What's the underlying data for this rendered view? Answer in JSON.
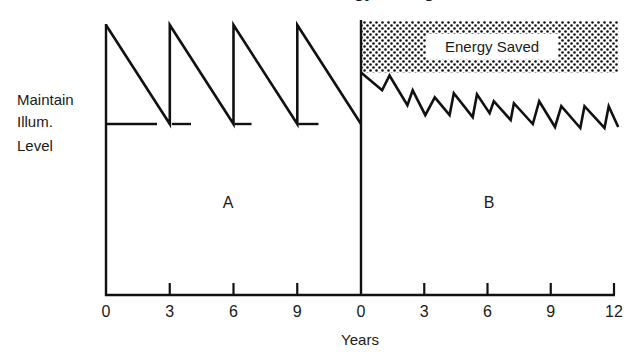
{
  "chart_data": {
    "type": "line",
    "title": "Energy Savings",
    "xlabel": "Years",
    "ylabel": "Maintain Illum. Level",
    "ylabel_lines": [
      "Maintain",
      "Illum.",
      "Level"
    ],
    "grid": false,
    "legend": null,
    "y_units": "relative illumination (maintain level = 0.0, initial = 1.0)",
    "ylim": [
      -1.0,
      1.0
    ],
    "panels": [
      {
        "name": "A",
        "label": "A",
        "xlim": [
          0,
          12
        ],
        "x_ticks": [
          0,
          3,
          6,
          9
        ],
        "x_tick_labels": [
          "0",
          "3",
          "6",
          "9"
        ],
        "series": [
          {
            "name": "Illumination (conventional relamping)",
            "points": [
              [
                0,
                1.0
              ],
              [
                3,
                0.0
              ],
              [
                3,
                1.0
              ],
              [
                6,
                0.0
              ],
              [
                6,
                1.0
              ],
              [
                9,
                0.0
              ],
              [
                9,
                1.0
              ],
              [
                12,
                0.0
              ]
            ]
          }
        ],
        "maintain_level_segments": [
          [
            0,
            2.4
          ],
          [
            3.1,
            4.0
          ],
          [
            6.05,
            6.85
          ],
          [
            9.05,
            10.0
          ]
        ],
        "maintain_level": 0.0
      },
      {
        "name": "B",
        "label": "B",
        "xlim": [
          0,
          12
        ],
        "x_ticks": [
          0,
          3,
          6,
          9,
          12
        ],
        "x_tick_labels": [
          "0",
          "3",
          "6",
          "9",
          "12"
        ],
        "series": [
          {
            "name": "Illumination (with controls)",
            "points": [
              [
                0,
                0.52
              ],
              [
                1.0,
                0.34
              ],
              [
                1.35,
                0.49
              ],
              [
                2.2,
                0.19
              ],
              [
                2.45,
                0.34
              ],
              [
                3.05,
                0.09
              ],
              [
                3.5,
                0.27
              ],
              [
                4.2,
                0.09
              ],
              [
                4.4,
                0.31
              ],
              [
                5.3,
                0.07
              ],
              [
                5.5,
                0.3
              ],
              [
                6.1,
                0.11
              ],
              [
                6.3,
                0.23
              ],
              [
                7.1,
                0.04
              ],
              [
                7.25,
                0.21
              ],
              [
                8.15,
                0.0
              ],
              [
                8.45,
                0.23
              ],
              [
                9.2,
                -0.03
              ],
              [
                9.5,
                0.18
              ],
              [
                10.4,
                -0.04
              ],
              [
                10.6,
                0.18
              ],
              [
                11.55,
                -0.04
              ],
              [
                11.75,
                0.18
              ],
              [
                12.2,
                -0.03
              ]
            ]
          }
        ],
        "energy_saved_region": {
          "y_range": [
            0.52,
            1.0
          ],
          "x_range": [
            0,
            12.2
          ],
          "label": "Energy Saved"
        }
      }
    ],
    "annotations": [
      "Energy Saved",
      "A",
      "B"
    ]
  }
}
